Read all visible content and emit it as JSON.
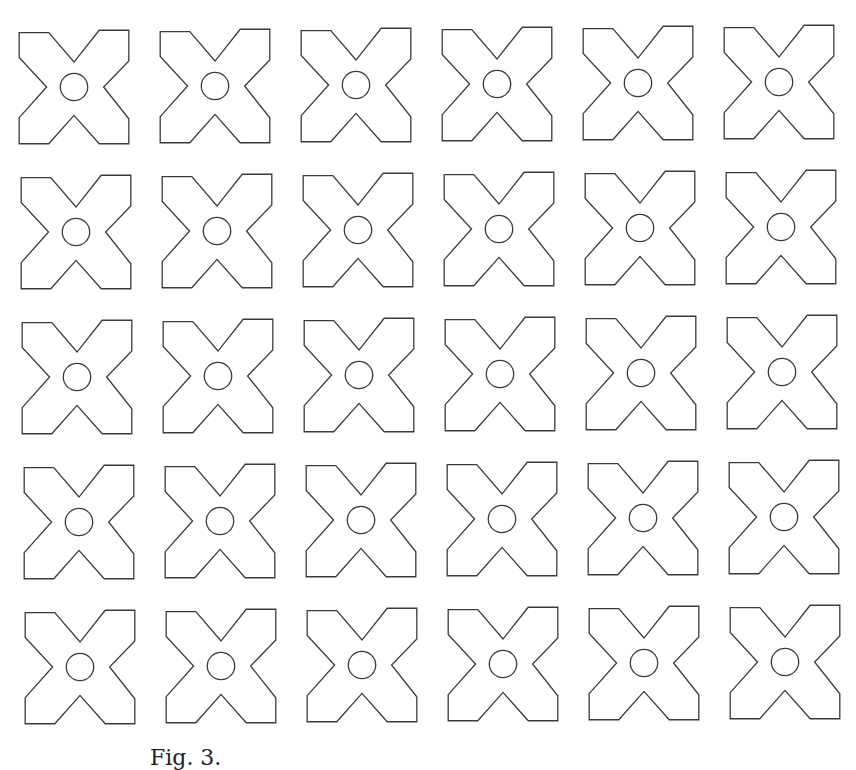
{
  "figure": {
    "rows": 5,
    "columns": 6,
    "shape": "cross-star-with-center-circle",
    "stroke_color": "#3a3a3a",
    "fill_color": "#ffffff",
    "origin": {
      "x": 17,
      "y": 28
    },
    "pitch": {
      "x": 141,
      "y": 145
    },
    "skew": {
      "x_per_row": 1.5,
      "y_per_col": -1
    },
    "tile_size": {
      "w": 114,
      "h": 118
    }
  },
  "caption": {
    "text": "Fig. 3."
  }
}
